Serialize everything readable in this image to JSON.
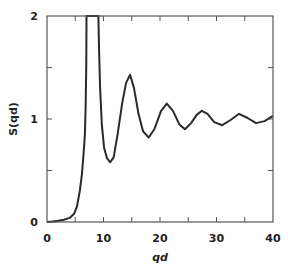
{
  "chart_data": {
    "type": "line",
    "title": "",
    "xlabel": "qd",
    "ylabel": "S(qd)",
    "xlim": [
      0,
      40
    ],
    "ylim": [
      0,
      2
    ],
    "grid": false,
    "legend": null,
    "x_ticks_major": [
      0,
      10,
      20,
      30,
      40
    ],
    "x_ticks_minor": [
      5,
      15,
      25,
      35
    ],
    "y_ticks_major": [
      0,
      1,
      2
    ],
    "y_ticks_minor": [
      0.5,
      1.5
    ],
    "series": [
      {
        "name": "S(qd)",
        "color": "#2a2a2a",
        "clipped_above": 2,
        "x": [
          0,
          1,
          2,
          3,
          4,
          4.8,
          5.3,
          5.8,
          6.2,
          6.5,
          6.7,
          6.85,
          6.95,
          7.0,
          9.1,
          9.2,
          9.4,
          9.7,
          10.1,
          10.6,
          11.2,
          11.8,
          12.5,
          13.3,
          14.0,
          14.7,
          15.4,
          16.2,
          17.0,
          18.0,
          19.0,
          20.2,
          21.2,
          22.3,
          23.4,
          24.4,
          25.5,
          26.5,
          27.4,
          28.4,
          29.6,
          31.0,
          32.5,
          34.0,
          35.5,
          37.0,
          38.5,
          40.0
        ],
        "y": [
          0.0,
          0.005,
          0.012,
          0.022,
          0.04,
          0.08,
          0.15,
          0.3,
          0.47,
          0.68,
          0.85,
          1.15,
          1.55,
          2.0,
          2.0,
          1.7,
          1.3,
          0.95,
          0.72,
          0.62,
          0.58,
          0.63,
          0.85,
          1.15,
          1.35,
          1.43,
          1.3,
          1.05,
          0.88,
          0.82,
          0.9,
          1.08,
          1.15,
          1.08,
          0.95,
          0.9,
          0.96,
          1.04,
          1.08,
          1.05,
          0.97,
          0.94,
          0.99,
          1.05,
          1.01,
          0.96,
          0.98,
          1.03
        ]
      }
    ]
  }
}
